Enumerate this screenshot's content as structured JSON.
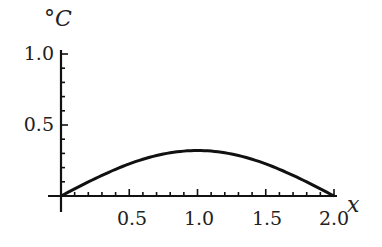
{
  "chart_data": {
    "type": "line",
    "title": "",
    "xlabel": "x",
    "ylabel": "°C",
    "xlim": [
      0,
      2.0
    ],
    "ylim": [
      0,
      1.0
    ],
    "x_ticks": [
      "0.5",
      "1.0",
      "1.5",
      "2.0"
    ],
    "y_ticks": [
      "0.5",
      "1.0"
    ],
    "grid": false,
    "legend": null,
    "series": [
      {
        "name": "temperature",
        "x": [
          0,
          0.25,
          0.5,
          0.75,
          1.0,
          1.25,
          1.5,
          1.75,
          2.0
        ],
        "y": [
          0,
          0.122,
          0.226,
          0.296,
          0.32,
          0.296,
          0.226,
          0.122,
          0
        ]
      }
    ],
    "color": "#111111"
  }
}
